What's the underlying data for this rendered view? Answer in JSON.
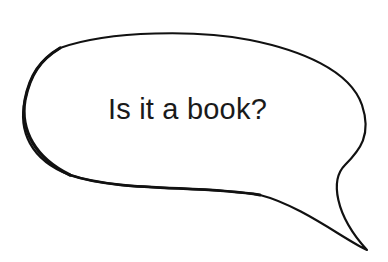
{
  "speech_bubble": {
    "text": "Is it a book?",
    "stroke_color": "#111111",
    "fill_color": "#ffffff"
  }
}
